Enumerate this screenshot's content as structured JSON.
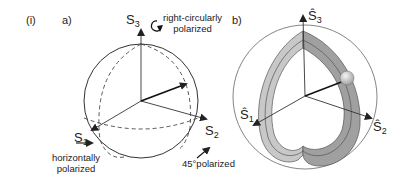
{
  "figure": {
    "label": "(i)",
    "panel_a": {
      "label": "a)",
      "axes": {
        "s1": {
          "symbol": "S",
          "sub": "1",
          "note": "horizontally polarized",
          "note_line1": "horizontally",
          "note_line2": "polarized"
        },
        "s2": {
          "symbol": "S",
          "sub": "2",
          "note": "45° polarized",
          "note_text": "45°polarized"
        },
        "s3": {
          "symbol": "S",
          "sub": "3",
          "note": "right-circularly polarized",
          "note_line1": "right-circularly",
          "note_line2": "polarized"
        }
      }
    },
    "panel_b": {
      "label": "b)",
      "axes": {
        "s1": {
          "symbol": "Ŝ",
          "sub": "1"
        },
        "s2": {
          "symbol": "Ŝ",
          "sub": "2"
        },
        "s3": {
          "symbol": "Ŝ",
          "sub": "3"
        }
      }
    }
  },
  "colors": {
    "line": "#222222",
    "sphere": "#444444",
    "band_light": "#c8c8c8",
    "band_dark": "#9a9a9a",
    "ball": "#d8d8d8"
  }
}
